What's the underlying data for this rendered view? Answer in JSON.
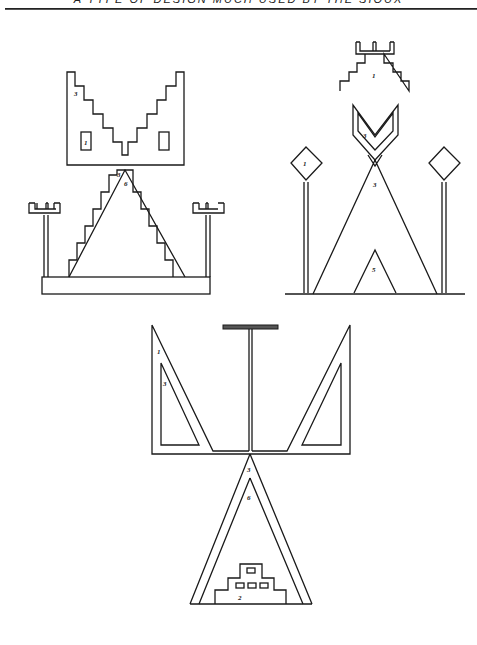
{
  "header": {
    "title": "A TYPE OF DESIGN MUCH USED BY THE SIOUX"
  },
  "figures": {
    "top_left": {
      "labels": {
        "v_band": "3",
        "left_box": "1",
        "apex_outer": "3",
        "apex_inner": "6"
      }
    },
    "top_right": {
      "labels": {
        "stepped": "1",
        "chevron": "3",
        "diamond": "1",
        "triangle": "3",
        "small_triangle": "5"
      }
    },
    "bottom": {
      "labels": {
        "left_outer": "1",
        "left_inner": "3",
        "tri_outer": "3",
        "tri_inner": "6",
        "stepped_base": "2"
      }
    }
  },
  "colors": {
    "ink": "#1a1a1a",
    "paper": "#ffffff"
  }
}
